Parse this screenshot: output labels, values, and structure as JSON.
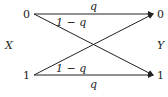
{
  "diagram": {
    "type": "binary-channel",
    "input_label": "X",
    "output_label": "Y",
    "input_nodes": [
      "0",
      "1"
    ],
    "output_nodes": [
      "0",
      "1"
    ],
    "edges": [
      {
        "from": "0",
        "to": "0",
        "label": "q"
      },
      {
        "from": "0",
        "to": "1",
        "label": "1 − q"
      },
      {
        "from": "1",
        "to": "0",
        "label": "1 − q"
      },
      {
        "from": "1",
        "to": "1",
        "label": "q"
      }
    ],
    "color": "#222222"
  }
}
